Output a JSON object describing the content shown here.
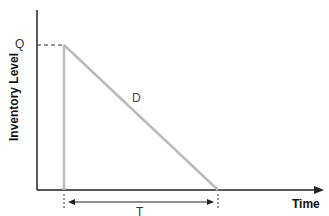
{
  "diagram": {
    "y_axis_label": "Inventory Level",
    "x_axis_label": "Time",
    "level_label": "Q",
    "demand_label": "D",
    "period_label": "T",
    "colors": {
      "axis": "#222222",
      "inventory_line": "#bbbbbb",
      "dashed_guide": "#333333",
      "dimension_line": "#222222"
    }
  }
}
